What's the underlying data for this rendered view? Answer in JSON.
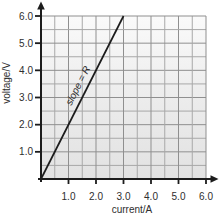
{
  "chart_data": {
    "type": "line",
    "title": "",
    "xlabel": "current/A",
    "ylabel": "voltage/V",
    "xlim": [
      0,
      6
    ],
    "ylim": [
      0,
      6
    ],
    "x_ticks": [
      1.0,
      2.0,
      3.0,
      4.0,
      5.0,
      6.0
    ],
    "y_ticks": [
      1.0,
      2.0,
      3.0,
      4.0,
      5.0,
      6.0
    ],
    "x_tick_labels": [
      "1.0",
      "2.0",
      "3.0",
      "4.0",
      "5.0",
      "6.0"
    ],
    "y_tick_labels": [
      "1.0",
      "2.0",
      "3.0",
      "4.0",
      "5.0",
      "6.0"
    ],
    "grid": true,
    "minor_grid_step": 0.5,
    "major_grid_step": 1.0,
    "legend": "none",
    "series": [
      {
        "name": "V-I characteristic",
        "x": [
          0,
          3.0
        ],
        "y": [
          0,
          6.0
        ],
        "slope": 2.0,
        "color": "#1c1c1c"
      }
    ],
    "annotations": [
      {
        "text": "slope = R",
        "x": 1.45,
        "y": 3.38,
        "rotation_deg": -63,
        "style": "italic"
      }
    ],
    "colors": {
      "axis": "#1c1c1c",
      "grid_minor": "#a8a8a8",
      "grid_major": "#8f8f8f",
      "plot_bg_top": "#fafafa",
      "plot_bg_mid": "#ebebeb",
      "plot_bg_bottom": "#e2e2e2",
      "text": "#2e2e2e"
    }
  }
}
